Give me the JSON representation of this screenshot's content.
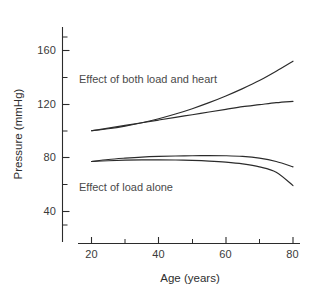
{
  "chart_data": {
    "type": "line",
    "title": "",
    "subtitle": "",
    "xlabel": "Age (years)",
    "ylabel": "Pressure (mmHg)",
    "xlim": [
      17,
      81
    ],
    "ylim": [
      22,
      176
    ],
    "xticks": [
      20,
      40,
      60,
      80
    ],
    "xtick_labels": [
      "20",
      "40",
      "60",
      "80"
    ],
    "x_minor_ticks": [
      30,
      50,
      70
    ],
    "yticks": [
      40,
      80,
      120,
      160
    ],
    "ytick_labels": [
      "40",
      "80",
      "120",
      "160"
    ],
    "y_minor_ticks": [
      60,
      100,
      140,
      170
    ],
    "grid": false,
    "legend": "none",
    "line_color": "#2b2b2b",
    "x": [
      20,
      25,
      30,
      35,
      40,
      45,
      50,
      55,
      60,
      65,
      70,
      75,
      80
    ],
    "series": [
      {
        "name": "Systolic - effect of both load and heart",
        "group": "Effect of both load and heart",
        "values": [
          100,
          101.5,
          103.5,
          106,
          109,
          112.5,
          116.5,
          121,
          126,
          131.5,
          137.5,
          144.5,
          152
        ]
      },
      {
        "name": "Systolic - effect of load alone",
        "group": "Effect of both load and heart",
        "values": [
          100,
          102,
          104,
          106,
          108,
          110,
          112,
          114,
          116,
          118,
          119.5,
          121,
          122
        ]
      },
      {
        "name": "Diastolic - effect of load alone",
        "group": "Effect of load alone",
        "values": [
          77,
          78.5,
          79.5,
          80.3,
          80.8,
          81.1,
          81.3,
          81.4,
          81.3,
          80.8,
          79.5,
          77,
          73
        ]
      },
      {
        "name": "Diastolic - effect of both load and heart",
        "group": "Effect of load alone",
        "values": [
          77,
          77.6,
          78,
          78.2,
          78.2,
          78.1,
          77.8,
          77.3,
          76.5,
          75.2,
          73,
          69,
          59
        ]
      }
    ],
    "annotations": [
      {
        "text": "Effect of both load and heart",
        "x": 26,
        "y": 133
      },
      {
        "text": "Effect of load alone",
        "x": 26,
        "y": 53
      }
    ]
  },
  "axes": {
    "y_title": "Pressure (mmHg)",
    "x_title": "Age (years)",
    "y_ticks": [
      {
        "label": "160"
      },
      {
        "label": "120"
      },
      {
        "label": "80"
      },
      {
        "label": "40"
      }
    ],
    "x_ticks": [
      {
        "label": "20"
      },
      {
        "label": "40"
      },
      {
        "label": "60"
      },
      {
        "label": "80"
      }
    ]
  },
  "annotations": {
    "upper": "Effect of both load and heart",
    "lower": "Effect of load alone"
  }
}
